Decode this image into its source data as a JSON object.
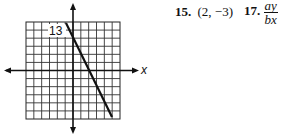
{
  "graph": {
    "label": "13",
    "axis_label_x": "x",
    "grid": {
      "cols": 12,
      "rows": 12
    },
    "line": {
      "from": [
        0,
        6
      ],
      "to": [
        4,
        -6
      ]
    }
  },
  "answers": [
    {
      "number": "15.",
      "text": "(2, −3)"
    },
    {
      "number": "17.",
      "numerator": "ay",
      "denominator": "bx"
    }
  ]
}
